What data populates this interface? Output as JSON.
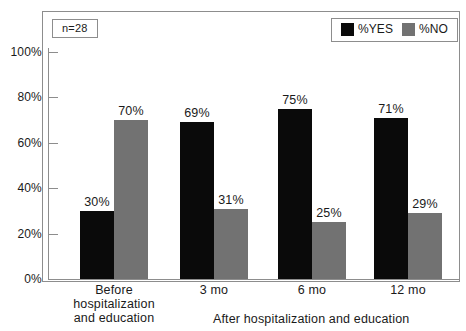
{
  "chart_data": {
    "type": "bar",
    "title": "",
    "subtitle": "",
    "xlabel": "",
    "ylabel": "",
    "ylim": [
      0,
      100
    ],
    "grid": false,
    "legend_position": "top-right",
    "annotation": "n=28",
    "categories": [
      "Before hospitalization and education",
      "3 mo",
      "6 mo",
      "12 mo"
    ],
    "category_lines": [
      [
        "Before",
        "hospitalization",
        "and education"
      ],
      [
        "3 mo"
      ],
      [
        "6 mo"
      ],
      [
        "12 mo"
      ]
    ],
    "group_label": "After hospitalization and education",
    "series": [
      {
        "name": "%YES",
        "color": "#0a0a0a",
        "values": [
          30,
          69,
          75,
          71
        ],
        "labels": [
          "30%",
          "69%",
          "75%",
          "71%"
        ]
      },
      {
        "name": "%NO",
        "color": "#727272",
        "values": [
          70,
          31,
          25,
          29
        ],
        "labels": [
          "70%",
          "31%",
          "25%",
          "29%"
        ]
      }
    ],
    "yticks": [
      0,
      20,
      40,
      60,
      80,
      100
    ],
    "ytick_labels": [
      "0%",
      "20%",
      "40%",
      "60%",
      "80%",
      "100%"
    ]
  },
  "legend": {
    "items": [
      {
        "label": "%YES",
        "swatch": "black-swatch-icon"
      },
      {
        "label": "%NO",
        "swatch": "gray-swatch-icon"
      }
    ]
  },
  "badge": {
    "sample_size": "n=28"
  },
  "colors": {
    "yes": "#0a0a0a",
    "no": "#727272",
    "frame": "#8d8d8d",
    "text": "#1a1a1a",
    "background": "#ffffff"
  }
}
